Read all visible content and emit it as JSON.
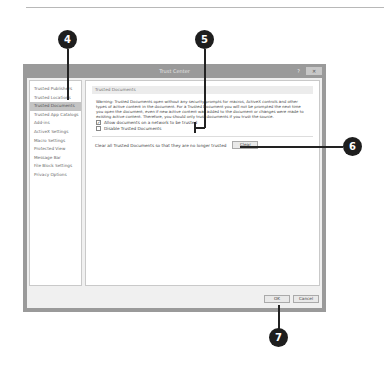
{
  "dialog": {
    "title": "Trust Center",
    "help_label": "?",
    "close_label": "✕",
    "sidebar": {
      "items": [
        {
          "label": "Trusted Publishers"
        },
        {
          "label": "Trusted Locations"
        },
        {
          "label": "Trusted Documents"
        },
        {
          "label": "Trusted App Catalogs"
        },
        {
          "label": "Add-ins"
        },
        {
          "label": "ActiveX Settings"
        },
        {
          "label": "Macro Settings"
        },
        {
          "label": "Protected View"
        },
        {
          "label": "Message Bar"
        },
        {
          "label": "File Block Settings"
        },
        {
          "label": "Privacy Options"
        }
      ],
      "active_index": 2
    },
    "main": {
      "section_title": "Trusted Documents",
      "warning": "Warning: Trusted Documents open without any security prompts for macros, ActiveX controls and other types of active content in the document. For a Trusted Document you will not be prompted the next time you open the document, even if new active content was added to the document or changes were made to existing active content. Therefore, you should only trust documents if you trust the source.",
      "checkbox_allow_network": {
        "label": "Allow documents on a network to be trusted",
        "checked": true
      },
      "checkbox_disable": {
        "label": "Disable Trusted Documents",
        "checked": false
      },
      "clear_text": "Clear all Trusted Documents so that they are no longer trusted",
      "clear_button": "Clear"
    },
    "footer": {
      "ok": "OK",
      "cancel": "Cancel"
    }
  },
  "callouts": {
    "c4": "4",
    "c5": "5",
    "c6": "6",
    "c7": "7"
  },
  "check_mark": "✓"
}
